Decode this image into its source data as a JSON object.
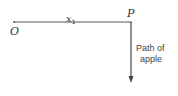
{
  "diagram": {
    "origin_label": "O",
    "point_label": "P",
    "distance_label": "x",
    "distance_subscript": "1",
    "path_label_line1": "Path of",
    "path_label_line2": "apple",
    "line_color": "#555555",
    "text_color": "#333333"
  }
}
